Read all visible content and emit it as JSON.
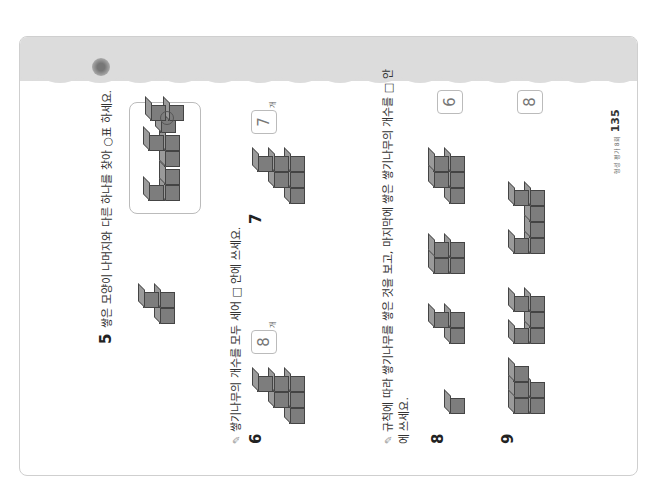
{
  "page": {
    "footer_label": "형성 평가 8회",
    "page_number": "135"
  },
  "q5": {
    "number": "5",
    "text": "쌓은 모양이 나머지와 다른 하나를 찾아 ○표 하세요.",
    "choices": [
      "choice-1",
      "choice-2",
      "choice-3"
    ],
    "circled_choice": 3
  },
  "section1": {
    "instruction": "쌓기나무의 개수를 모두 세어 □ 안에 쓰세요."
  },
  "q6": {
    "number": "6",
    "answer": "8",
    "unit": "개"
  },
  "q7": {
    "number": "7",
    "answer": "7",
    "unit": "개"
  },
  "section2": {
    "instruction": "규칙에 따라 쌓기나무를 쌓은 것을 보고, 마지막에 쌓은 쌓기나무의 개수를 □ 안에 쓰세요."
  },
  "q8": {
    "number": "8",
    "answer": "6"
  },
  "q9": {
    "number": "9",
    "answer": "8"
  }
}
